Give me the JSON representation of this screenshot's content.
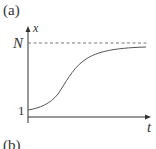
{
  "panel_label_top": "(a)",
  "panel_label_bottom": "(b)",
  "axes": {
    "y_label": "x",
    "x_label": "t"
  },
  "ticks": {
    "y_asymptote": "N",
    "y_initial": "1"
  },
  "curve": {
    "type": "logistic",
    "start": 1,
    "asymptote": "N"
  },
  "colors": {
    "axis": "#333333",
    "curve": "#555555",
    "dashed": "#777777"
  }
}
